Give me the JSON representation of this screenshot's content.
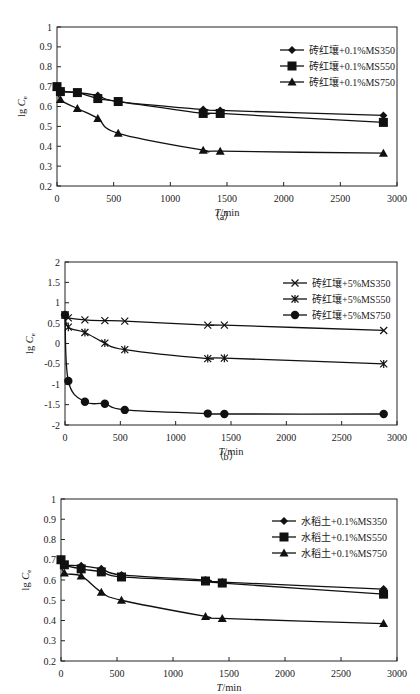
{
  "chart_data": [
    {
      "id": "a",
      "type": "line",
      "caption": "（a）",
      "xlabel_italic": "T",
      "xlabel_rest": "/min",
      "ylabel": "lg C",
      "ylabel_sub": "e",
      "xlim": [
        0,
        3000
      ],
      "ylim": [
        0.2,
        1
      ],
      "xticks": [
        0,
        500,
        1000,
        1500,
        2000,
        2500,
        3000
      ],
      "yticks": [
        0.2,
        0.3,
        0.4,
        0.5,
        0.6,
        0.7,
        0.8,
        0.9,
        1
      ],
      "ytick_labels": [
        "0.2",
        "0.3",
        "0.4",
        "0.5",
        "0.6",
        "0.7",
        "0.8",
        "0.9",
        "1"
      ],
      "grid": false,
      "legend_position": "upper right",
      "x": [
        0,
        30,
        180,
        360,
        540,
        1290,
        1440,
        2880
      ],
      "series": [
        {
          "name": "砖红壤+0.1%MS350",
          "marker": "diamond",
          "values": [
            0.7,
            0.68,
            0.67,
            0.655,
            0.625,
            0.585,
            0.58,
            0.555
          ]
        },
        {
          "name": "砖红壤+0.1%MS550",
          "marker": "square",
          "values": [
            0.7,
            0.675,
            0.67,
            0.64,
            0.625,
            0.565,
            0.565,
            0.52
          ]
        },
        {
          "name": "砖红壤+0.1%MS750",
          "marker": "triangle",
          "values": [
            0.7,
            0.635,
            0.59,
            0.54,
            0.465,
            0.38,
            0.375,
            0.365
          ]
        }
      ]
    },
    {
      "id": "b",
      "type": "line",
      "caption": "（b）",
      "xlabel_italic": "T",
      "xlabel_rest": "/min",
      "ylabel": "lg C",
      "ylabel_sub": "e",
      "xlim": [
        0,
        3000
      ],
      "ylim": [
        -2,
        2
      ],
      "xticks": [
        0,
        500,
        1000,
        1500,
        2000,
        2500,
        3000
      ],
      "yticks": [
        -2,
        -1.5,
        -1,
        -0.5,
        0,
        0.5,
        1,
        1.5,
        2
      ],
      "ytick_labels": [
        "-2",
        "-1.5",
        "-1",
        "-0.5",
        "0",
        "0.5",
        "1",
        "1.5",
        "2"
      ],
      "grid": false,
      "legend_position": "upper right",
      "x": [
        0,
        30,
        180,
        360,
        540,
        1290,
        1440,
        2880
      ],
      "series": [
        {
          "name": "砖红壤+5%MS350",
          "marker": "x",
          "values": [
            0.7,
            0.63,
            0.58,
            0.56,
            0.55,
            0.45,
            0.45,
            0.32
          ]
        },
        {
          "name": "砖红壤+5%MS550",
          "marker": "star",
          "values": [
            0.7,
            0.4,
            0.27,
            0.01,
            -0.15,
            -0.37,
            -0.36,
            -0.5
          ]
        },
        {
          "name": "砖红壤+5%MS750",
          "marker": "circle",
          "values": [
            0.7,
            -0.92,
            -1.43,
            -1.48,
            -1.63,
            -1.72,
            -1.73,
            -1.73
          ]
        }
      ]
    },
    {
      "id": "c",
      "type": "line",
      "caption": "",
      "xlabel_italic": "T",
      "xlabel_rest": "/min",
      "ylabel": "lg C",
      "ylabel_sub": "e",
      "xlim": [
        0,
        3000
      ],
      "ylim": [
        0.2,
        1
      ],
      "xticks": [
        0,
        500,
        1000,
        1500,
        2000,
        2500,
        3000
      ],
      "yticks": [
        0.2,
        0.3,
        0.4,
        0.5,
        0.6,
        0.7,
        0.8,
        0.9,
        1
      ],
      "ytick_labels": [
        "0.2",
        "0.3",
        "0.4",
        "0.5",
        "0.6",
        "0.7",
        "0.8",
        "0.9",
        "1"
      ],
      "grid": false,
      "legend_position": "upper right",
      "x": [
        0,
        30,
        180,
        360,
        540,
        1290,
        1440,
        2880
      ],
      "series": [
        {
          "name": "水稻土+0.1%MS350",
          "marker": "diamond",
          "values": [
            0.7,
            0.675,
            0.67,
            0.655,
            0.625,
            0.6,
            0.59,
            0.555
          ]
        },
        {
          "name": "水稻土+0.1%MS550",
          "marker": "square",
          "values": [
            0.7,
            0.675,
            0.655,
            0.64,
            0.615,
            0.595,
            0.585,
            0.53
          ]
        },
        {
          "name": "水稻土+0.1%MS750",
          "marker": "triangle",
          "values": [
            0.7,
            0.635,
            0.62,
            0.54,
            0.5,
            0.42,
            0.41,
            0.385
          ]
        }
      ]
    }
  ]
}
